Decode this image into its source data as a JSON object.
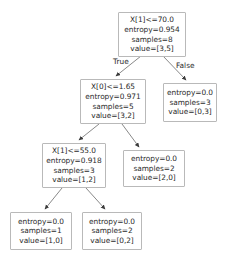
{
  "diagram": {
    "type": "decision-tree",
    "title": "",
    "background_color": "#ffffff",
    "node_border_color": "#b9b9b9",
    "node_fill_color": "#ffffff",
    "edge_color": "#6b6b6b",
    "text_color": "#2b2b2b",
    "edge_labels": {
      "true": "True",
      "false": "False"
    },
    "nodes": [
      {
        "id": "root",
        "kind": "decision",
        "condition": "X[1]<=70.0",
        "entropy": "entropy=0.954",
        "samples": "samples=8",
        "value": "value=[3,5]"
      },
      {
        "id": "n-right-1",
        "kind": "leaf",
        "condition": "",
        "entropy": "entropy=0.0",
        "samples": "samples=3",
        "value": "value=[0,3]"
      },
      {
        "id": "n-left-1",
        "kind": "decision",
        "condition": "X[0]<=1.65",
        "entropy": "entropy=0.971",
        "samples": "samples=5",
        "value": "value=[3,2]"
      },
      {
        "id": "n-left-2",
        "kind": "decision",
        "condition": "X[1]<=55.0",
        "entropy": "entropy=0.918",
        "samples": "samples=3",
        "value": "value=[1,2]"
      },
      {
        "id": "n-right-2",
        "kind": "leaf",
        "condition": "",
        "entropy": "entropy=0.0",
        "samples": "samples=2",
        "value": "value=[2,0]"
      },
      {
        "id": "n-leaf-left",
        "kind": "leaf",
        "condition": "",
        "entropy": "entropy=0.0",
        "samples": "samples=1",
        "value": "value=[1,0]"
      },
      {
        "id": "n-leaf-right",
        "kind": "leaf",
        "condition": "",
        "entropy": "entropy=0.0",
        "samples": "samples=2",
        "value": "value=[0,2]"
      }
    ]
  }
}
